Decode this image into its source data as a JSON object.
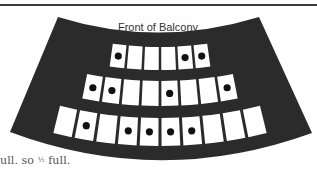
{
  "diagram": {
    "title": "Front of Balcony",
    "colors": {
      "balcony": "#2b2b2b",
      "seat": "#ffffff",
      "occupied_dot": "#111111",
      "rule": "#3a3a3a"
    },
    "rows": [
      {
        "row": 1,
        "seats": 6,
        "occupied": [
          1,
          5,
          6
        ]
      },
      {
        "row": 2,
        "seats": 8,
        "occupied": [
          1,
          2,
          5,
          8
        ]
      },
      {
        "row": 3,
        "seats": 10,
        "occupied": [
          2,
          4,
          5,
          6,
          7
        ]
      }
    ],
    "totals": {
      "seats": 24,
      "occupied": 12
    }
  },
  "caption": {
    "prefix": "ull. so ",
    "fraction": "½",
    "suffix": " full."
  }
}
